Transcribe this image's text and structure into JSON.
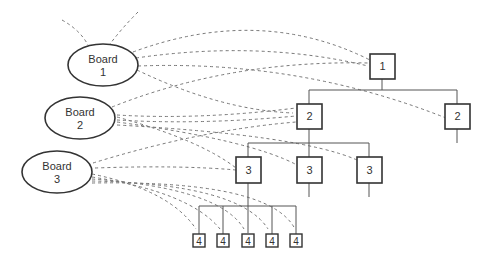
{
  "diagram": {
    "boards": [
      {
        "id": "board1",
        "line1": "Board",
        "line2": "1"
      },
      {
        "id": "board2",
        "line1": "Board",
        "line2": "2"
      },
      {
        "id": "board3",
        "line1": "Board",
        "line2": "3"
      }
    ],
    "tree": {
      "level1": [
        {
          "label": "1"
        }
      ],
      "level2": [
        {
          "label": "2"
        },
        {
          "label": "2"
        }
      ],
      "level3": [
        {
          "label": "3"
        },
        {
          "label": "3"
        },
        {
          "label": "3"
        }
      ],
      "level4": [
        {
          "label": "4"
        },
        {
          "label": "4"
        },
        {
          "label": "4"
        },
        {
          "label": "4"
        },
        {
          "label": "4"
        }
      ]
    },
    "colors": {
      "stroke": "#333333",
      "dash": "#777777",
      "background": "#ffffff"
    }
  }
}
